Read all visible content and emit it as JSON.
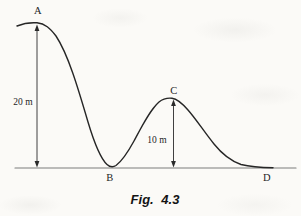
{
  "figure": {
    "caption": "Fig. 4.3",
    "point_labels": {
      "a": "A",
      "b": "B",
      "c": "C",
      "d": "D"
    },
    "measurements": {
      "left_height": "20 m",
      "right_height": "10 m"
    },
    "colors": {
      "curve": "#262626",
      "baseline": "#7d7d7d",
      "arrow": "#2a2a2a",
      "text": "#1e1e1e",
      "background": "#fbfaf7"
    },
    "diagram_semantics": {
      "type": "height-profile-curve",
      "description": "Track profile from A (height 20 m) descending to ground at B, rising over hump C (height 10 m), descending to ground at D",
      "heights_m": {
        "A": 20,
        "C": 10,
        "B": 0,
        "D": 0
      }
    }
  }
}
